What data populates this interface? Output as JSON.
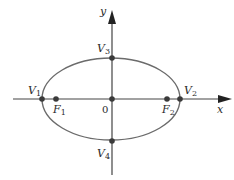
{
  "diagram": {
    "type": "ellipse-on-axes",
    "axes": {
      "x_label": "x",
      "y_label": "y",
      "origin_label": "0"
    },
    "points": [
      {
        "id": "V1",
        "name": "V",
        "sub": "1",
        "role": "vertex"
      },
      {
        "id": "V2",
        "name": "V",
        "sub": "2",
        "role": "vertex"
      },
      {
        "id": "V3",
        "name": "V",
        "sub": "3",
        "role": "co-vertex"
      },
      {
        "id": "V4",
        "name": "V",
        "sub": "4",
        "role": "co-vertex"
      },
      {
        "id": "F1",
        "name": "F",
        "sub": "1",
        "role": "focus"
      },
      {
        "id": "F2",
        "name": "F",
        "sub": "2",
        "role": "focus"
      },
      {
        "id": "O",
        "name": "0",
        "role": "center"
      }
    ],
    "colors": {
      "ellipse": "#6b6b6b",
      "axis": "#444444",
      "point": "#3a3a3a"
    }
  }
}
